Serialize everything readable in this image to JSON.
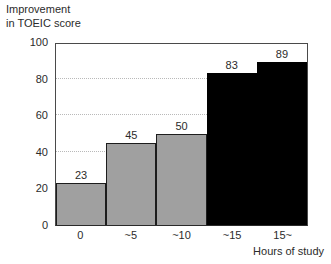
{
  "chart_data": {
    "type": "bar",
    "title": "",
    "ylabel_lines": [
      "Improvement",
      "in TOEIC score"
    ],
    "xlabel": "Hours of study",
    "categories": [
      "0",
      "~5",
      "~10",
      "~15",
      "15~"
    ],
    "values": [
      23,
      45,
      50,
      83,
      89
    ],
    "value_labels": [
      "23",
      "45",
      "50",
      "83",
      "89"
    ],
    "bar_colors": [
      "#a0a0a0",
      "#a0a0a0",
      "#a0a0a0",
      "#000000",
      "#000000"
    ],
    "bar_color_classes": [
      "gray",
      "gray",
      "gray",
      "black",
      "black"
    ],
    "ylim": [
      0,
      100
    ],
    "yticks": [
      0,
      20,
      40,
      60,
      80,
      100
    ],
    "ytick_labels": [
      "0",
      "20",
      "40",
      "60",
      "80",
      "100"
    ],
    "grid": true,
    "grid_axis": "y",
    "grid_style": "dotted",
    "grid_color": "#b9b9b9",
    "legend": null,
    "axis_color": "#4a4a4a",
    "text_color": "#2b2b2b",
    "bar_gap": 0
  }
}
